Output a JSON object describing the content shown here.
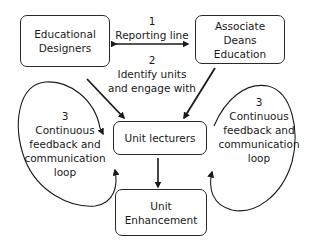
{
  "nodes": {
    "educational_designers": {
      "lines": [
        "Educational",
        "Designers"
      ]
    },
    "associate_deans": {
      "lines": [
        "Associate",
        "Deans",
        "Education"
      ]
    },
    "unit_lecturers": {
      "lines": [
        "Unit lecturers"
      ]
    },
    "unit_enhancement": {
      "lines": [
        "Unit",
        "Enhancement"
      ]
    }
  },
  "edges": {
    "reporting": {
      "number": "1",
      "label": "Reporting line"
    },
    "identify": {
      "number": "2",
      "line1": "Identify units",
      "line2": "and engage with"
    },
    "loop_left": {
      "number": "3",
      "lines": [
        "Continuous",
        "feedback and",
        "communication",
        "loop"
      ]
    },
    "loop_right": {
      "number": "3",
      "lines": [
        "Continuous",
        "feedback and",
        "communication",
        "loop"
      ]
    }
  },
  "colors": {
    "stroke": "#2a2a2a",
    "background": "#ffffff"
  }
}
